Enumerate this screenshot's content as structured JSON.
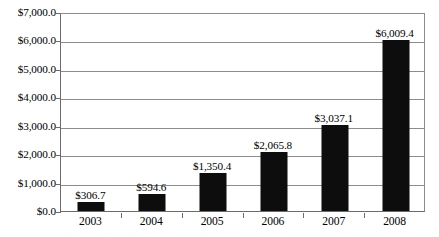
{
  "chart_data": {
    "type": "bar",
    "title": "",
    "xlabel": "",
    "ylabel": "",
    "categories": [
      "2003",
      "2004",
      "2005",
      "2006",
      "2007",
      "2008"
    ],
    "values": [
      306.7,
      594.6,
      1350.4,
      2065.8,
      3037.1,
      6009.4
    ],
    "value_labels": [
      "$306.7",
      "$594.6",
      "$1,350.4",
      "$2,065.8",
      "$3,037.1",
      "$6,009.4"
    ],
    "ylim": [
      0,
      7000
    ],
    "ytick_values": [
      0,
      1000,
      2000,
      3000,
      4000,
      5000,
      6000,
      7000
    ],
    "ytick_labels": [
      "$0.0",
      "$1,000.0",
      "$2,000.0",
      "$3,000.0",
      "$4,000.0",
      "$5,000.0",
      "$6,000.0",
      "$7,000.0"
    ],
    "grid": true,
    "legend": false,
    "bar_color": "#0d0d0d",
    "gridline_color": "#8c8c8c",
    "axis_color": "#6b6b6b",
    "background_color": "#ffffff"
  }
}
